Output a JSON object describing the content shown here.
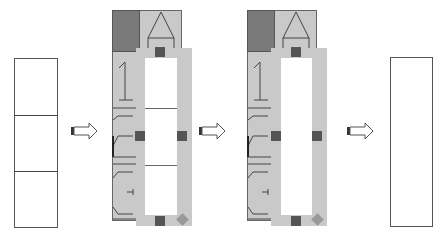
{
  "diagram": {
    "steps": [
      {
        "id": "before",
        "label": "",
        "cells": 3
      },
      {
        "id": "selected",
        "label": "",
        "cells": 3,
        "selection_handles": 4
      },
      {
        "id": "merged-selected",
        "label": "",
        "cells": 1,
        "selection_handles": 4
      },
      {
        "id": "after",
        "label": "",
        "cells": 1
      }
    ],
    "arrows": 3,
    "colors": {
      "cell_border": "#555555",
      "panel_bg": "#c9c9c9",
      "header_dark": "#7a7a7a",
      "selection_frame": "#c9c9c9",
      "handle": "#555555",
      "corner_handle": "#999999"
    }
  }
}
